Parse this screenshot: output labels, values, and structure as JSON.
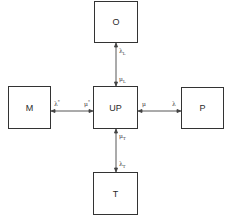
{
  "diagram": {
    "nodes": [
      {
        "id": "O",
        "label": "O"
      },
      {
        "id": "M",
        "label": "M"
      },
      {
        "id": "UP",
        "label": "UP"
      },
      {
        "id": "P",
        "label": "P"
      },
      {
        "id": "T",
        "label": "T"
      }
    ],
    "edges": {
      "top": {
        "from": "UP",
        "to": "O",
        "near_node_label": "λ",
        "near_node_sub": "L",
        "near_center_label": "μ",
        "near_center_sub": "L"
      },
      "left": {
        "from": "UP",
        "to": "M",
        "near_node_label": "λ",
        "near_node_sup": "*",
        "near_center_label": "μ",
        "near_center_sup": "*"
      },
      "right": {
        "from": "UP",
        "to": "P",
        "near_node_label": "λ",
        "near_center_label": "μ"
      },
      "bottom": {
        "from": "UP",
        "to": "T",
        "near_node_label": "λ",
        "near_node_sub": "T",
        "near_center_label": "μ",
        "near_center_sub": "T"
      }
    }
  }
}
